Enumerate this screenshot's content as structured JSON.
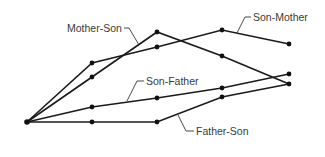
{
  "diagram": {
    "type": "line-path-diagram",
    "origin": [
      27,
      122
    ],
    "series": [
      {
        "name": "Mother-Son",
        "points": [
          [
            27,
            122
          ],
          [
            92,
            77
          ],
          [
            157,
            32
          ],
          [
            222,
            56
          ],
          [
            289,
            84
          ]
        ],
        "label": {
          "text": "Mother-Son",
          "x": 67,
          "y": 32,
          "leader": "M 124 28 L 129 28 L 139 45"
        }
      },
      {
        "name": "Son-Mother",
        "points": [
          [
            27,
            122
          ],
          [
            92,
            63
          ],
          [
            157,
            47
          ],
          [
            222,
            30
          ],
          [
            289,
            44
          ]
        ],
        "label": {
          "text": "Son-Mother",
          "x": 253,
          "y": 21,
          "leader": "M 251 17 L 245 17 L 237 33"
        }
      },
      {
        "name": "Son-Father",
        "points": [
          [
            27,
            122
          ],
          [
            92,
            107
          ],
          [
            157,
            98
          ],
          [
            222,
            88
          ],
          [
            289,
            74
          ]
        ],
        "label": {
          "text": "Son-Father",
          "x": 146,
          "y": 85,
          "leader": "M 144 81 L 137 81 L 127 101"
        }
      },
      {
        "name": "Father-Son",
        "points": [
          [
            27,
            122
          ],
          [
            92,
            122
          ],
          [
            157,
            122
          ],
          [
            222,
            97
          ],
          [
            289,
            84
          ]
        ],
        "label": {
          "text": "Father-Son",
          "x": 196,
          "y": 135,
          "leader": "M 194 131 L 186 131 L 178 115"
        }
      }
    ],
    "colors": {
      "line": "#1a1a1a",
      "text": "#3a3a3a",
      "background": "#ffffff"
    }
  }
}
